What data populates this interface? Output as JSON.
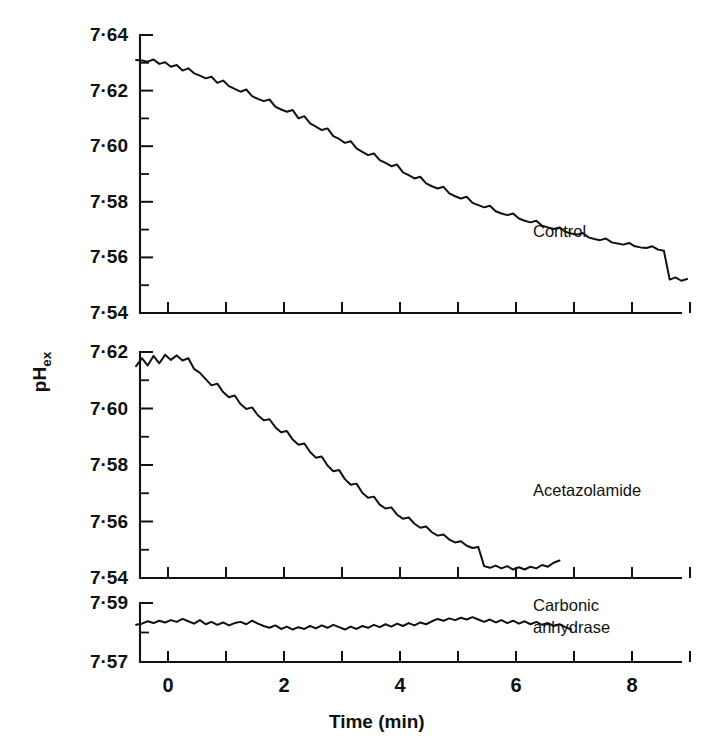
{
  "figure": {
    "axis_title_x": "Time (min)",
    "axis_title_y": "pH",
    "axis_title_y_sub": "ex",
    "panels": [
      {
        "name": "control",
        "label": "Control",
        "ylim": [
          7.54,
          7.64
        ],
        "yticks": [
          "7·64",
          "7·62",
          "7·60",
          "7·58",
          "7·56",
          "7·54"
        ],
        "ytick_values": [
          7.64,
          7.62,
          7.6,
          7.58,
          7.56,
          7.54
        ],
        "yminor_values": [
          7.63,
          7.61,
          7.59,
          7.57,
          7.55
        ]
      },
      {
        "name": "acetazolamide",
        "label": "Acetazolamide",
        "ylim": [
          7.54,
          7.62
        ],
        "yticks": [
          "7·62",
          "7·60",
          "7·58",
          "7·56",
          "7·54"
        ],
        "ytick_values": [
          7.62,
          7.6,
          7.58,
          7.56,
          7.54
        ],
        "yminor_values": [
          7.61,
          7.59,
          7.57,
          7.55
        ]
      },
      {
        "name": "carbonic-anhydrase",
        "label_line1": "Carbonic",
        "label_line2": "anhydrase",
        "label": "Carbonic anhydrase",
        "ylim": [
          7.57,
          7.59
        ],
        "yticks": [
          "7·59",
          "7·57"
        ],
        "ytick_values": [
          7.59,
          7.57
        ],
        "yminor_values": [
          7.58
        ]
      }
    ],
    "xticks_labeled": [
      "0",
      "2",
      "4",
      "6",
      "8"
    ],
    "xtick_label_values": [
      0,
      2,
      4,
      6,
      8
    ],
    "xtick_values": [
      0,
      1,
      2,
      3,
      4,
      5,
      6,
      7,
      8,
      9
    ],
    "colors": {
      "ink": "#111111",
      "background": "#ffffff"
    }
  },
  "chart_data": {
    "type": "line",
    "title": "",
    "xlabel": "Time (min)",
    "ylabel": "pHex",
    "grid": false,
    "legend": "inline-panel-labels",
    "panels": [
      {
        "name": "Control",
        "ylabel": "pHex",
        "xlim": [
          -0.6,
          9.0
        ],
        "ylim": [
          7.54,
          7.64
        ],
        "yticks": [
          7.54,
          7.56,
          7.58,
          7.6,
          7.62,
          7.64
        ],
        "xticks": [
          0,
          1,
          2,
          3,
          4,
          5,
          6,
          7,
          8,
          9
        ],
        "series": [
          {
            "name": "Control",
            "x": [
              -0.55,
              -0.45,
              -0.35,
              -0.25,
              -0.15,
              -0.05,
              0.05,
              0.15,
              0.25,
              0.35,
              0.45,
              0.55,
              0.65,
              0.75,
              0.85,
              0.95,
              1.05,
              1.15,
              1.25,
              1.35,
              1.45,
              1.55,
              1.65,
              1.75,
              1.85,
              1.95,
              2.05,
              2.15,
              2.25,
              2.35,
              2.45,
              2.55,
              2.65,
              2.75,
              2.85,
              2.95,
              3.05,
              3.15,
              3.25,
              3.35,
              3.45,
              3.55,
              3.65,
              3.75,
              3.85,
              3.95,
              4.05,
              4.15,
              4.25,
              4.35,
              4.45,
              4.55,
              4.65,
              4.75,
              4.85,
              4.95,
              5.05,
              5.15,
              5.25,
              5.35,
              5.45,
              5.55,
              5.65,
              5.75,
              5.85,
              5.95,
              6.05,
              6.15,
              6.25,
              6.35,
              6.45,
              6.55,
              6.65,
              6.75,
              6.85,
              6.95,
              7.05,
              7.15,
              7.25,
              7.35,
              7.45,
              7.55,
              7.65,
              7.75,
              7.85,
              7.95,
              8.05,
              8.15,
              8.25,
              8.35,
              8.45,
              8.55,
              8.65,
              8.75,
              8.85,
              8.95
            ],
            "y": [
              7.631,
              7.6308,
              7.6304,
              7.6312,
              7.6296,
              7.6302,
              7.6286,
              7.6292,
              7.6272,
              7.628,
              7.6262,
              7.6254,
              7.6244,
              7.625,
              7.6228,
              7.6236,
              7.6216,
              7.6206,
              7.6196,
              7.6204,
              7.618,
              7.617,
              7.6162,
              7.6168,
              7.6142,
              7.6132,
              7.6124,
              7.613,
              7.61,
              7.6108,
              7.6082,
              7.607,
              7.6058,
              7.6064,
              7.6036,
              7.6026,
              7.6012,
              7.6018,
              7.5992,
              7.598,
              7.5968,
              7.5974,
              7.595,
              7.594,
              7.5928,
              7.5934,
              7.5906,
              7.5896,
              7.5884,
              7.589,
              7.5866,
              7.5856,
              7.5848,
              7.5854,
              7.583,
              7.582,
              7.5812,
              7.5818,
              7.5796,
              7.5788,
              7.578,
              7.5786,
              7.5766,
              7.5758,
              7.5752,
              7.5758,
              7.574,
              7.5732,
              7.5726,
              7.5732,
              7.5714,
              7.5708,
              7.5702,
              7.5708,
              7.5692,
              7.5686,
              7.5682,
              7.5688,
              7.5672,
              7.5666,
              7.5662,
              7.5668,
              7.5654,
              7.565,
              7.5646,
              7.5652,
              7.564,
              7.5636,
              7.5634,
              7.564,
              7.5628,
              7.5624,
              7.552,
              7.5528,
              7.5516,
              7.5522
            ]
          }
        ]
      },
      {
        "name": "Acetazolamide",
        "ylabel": "pHex",
        "xlim": [
          -0.6,
          9.0
        ],
        "ylim": [
          7.54,
          7.62
        ],
        "yticks": [
          7.54,
          7.56,
          7.58,
          7.6,
          7.62
        ],
        "xticks": [
          0,
          1,
          2,
          3,
          4,
          5,
          6,
          7,
          8,
          9
        ],
        "series": [
          {
            "name": "Acetazolamide",
            "x": [
              -0.55,
              -0.45,
              -0.35,
              -0.25,
              -0.15,
              -0.05,
              0.05,
              0.15,
              0.25,
              0.35,
              0.45,
              0.55,
              0.65,
              0.75,
              0.85,
              0.95,
              1.05,
              1.15,
              1.25,
              1.35,
              1.45,
              1.55,
              1.65,
              1.75,
              1.85,
              1.95,
              2.05,
              2.15,
              2.25,
              2.35,
              2.45,
              2.55,
              2.65,
              2.75,
              2.85,
              2.95,
              3.05,
              3.15,
              3.25,
              3.35,
              3.45,
              3.55,
              3.65,
              3.75,
              3.85,
              3.95,
              4.05,
              4.15,
              4.25,
              4.35,
              4.45,
              4.55,
              4.65,
              4.75,
              4.85,
              4.95,
              5.05,
              5.15,
              5.25,
              5.35,
              5.45,
              5.55,
              5.65,
              5.75,
              5.85,
              5.95,
              6.05,
              6.15,
              6.25,
              6.35,
              6.45,
              6.55,
              6.65,
              6.75
            ],
            "y": [
              7.615,
              7.6178,
              7.6152,
              7.6186,
              7.616,
              7.619,
              7.6172,
              7.6188,
              7.617,
              7.6178,
              7.614,
              7.6126,
              7.6104,
              7.6082,
              7.6088,
              7.6058,
              7.604,
              7.6046,
              7.6016,
              7.5998,
              7.6004,
              7.5976,
              7.5958,
              7.5962,
              7.5934,
              7.5916,
              7.592,
              7.589,
              7.5872,
              7.5876,
              7.5846,
              7.5826,
              7.583,
              7.5798,
              7.5778,
              7.5782,
              7.575,
              7.573,
              7.5734,
              7.5702,
              7.5684,
              7.5688,
              7.566,
              7.5646,
              7.565,
              7.5624,
              7.561,
              7.5614,
              7.5592,
              7.5578,
              7.5582,
              7.5562,
              7.555,
              7.5554,
              7.5536,
              7.5526,
              7.553,
              7.5514,
              7.5506,
              7.551,
              7.5442,
              7.5436,
              7.5444,
              7.5434,
              7.5442,
              7.543,
              7.5438,
              7.543,
              7.544,
              7.5434,
              7.5446,
              7.544,
              7.5454,
              7.5462
            ]
          }
        ]
      },
      {
        "name": "Carbonic anhydrase",
        "ylabel": "pHex",
        "xlim": [
          -0.6,
          9.0
        ],
        "ylim": [
          7.57,
          7.59
        ],
        "yticks": [
          7.57,
          7.58,
          7.59
        ],
        "xticks": [
          0,
          1,
          2,
          3,
          4,
          5,
          6,
          7,
          8,
          9
        ],
        "series": [
          {
            "name": "Carbonic anhydrase",
            "x": [
              -0.55,
              -0.45,
              -0.35,
              -0.25,
              -0.15,
              -0.05,
              0.05,
              0.15,
              0.25,
              0.35,
              0.45,
              0.55,
              0.65,
              0.75,
              0.85,
              0.95,
              1.05,
              1.15,
              1.25,
              1.35,
              1.45,
              1.55,
              1.65,
              1.75,
              1.85,
              1.95,
              2.05,
              2.15,
              2.25,
              2.35,
              2.45,
              2.55,
              2.65,
              2.75,
              2.85,
              2.95,
              3.05,
              3.15,
              3.25,
              3.35,
              3.45,
              3.55,
              3.65,
              3.75,
              3.85,
              3.95,
              4.05,
              4.15,
              4.25,
              4.35,
              4.45,
              4.55,
              4.65,
              4.75,
              4.85,
              4.95,
              5.05,
              5.15,
              5.25,
              5.35,
              5.45,
              5.55,
              5.65,
              5.75,
              5.85,
              5.95,
              6.05,
              6.15,
              6.25,
              6.35,
              6.45,
              6.55,
              6.65,
              6.75,
              6.85,
              6.95
            ],
            "y": [
              7.5826,
              7.583,
              7.5838,
              7.5832,
              7.584,
              7.5834,
              7.5842,
              7.5836,
              7.5846,
              7.5838,
              7.583,
              7.5842,
              7.5828,
              7.5836,
              7.5826,
              7.5834,
              7.5824,
              7.5832,
              7.5836,
              7.5828,
              7.584,
              7.583,
              7.5822,
              7.5816,
              7.5824,
              7.5812,
              7.582,
              7.581,
              7.5818,
              7.5812,
              7.5822,
              7.5814,
              7.5824,
              7.5816,
              7.5826,
              7.5818,
              7.581,
              7.582,
              7.5812,
              7.5822,
              7.5816,
              7.5826,
              7.5818,
              7.5828,
              7.582,
              7.583,
              7.5822,
              7.5832,
              7.5824,
              7.5834,
              7.5828,
              7.5838,
              7.5846,
              7.584,
              7.5848,
              7.5842,
              7.585,
              7.5844,
              7.5852,
              7.5844,
              7.5836,
              7.5844,
              7.5834,
              7.5842,
              7.5832,
              7.584,
              7.583,
              7.5838,
              7.5828,
              7.5836,
              7.5826,
              7.5832,
              7.5822,
              7.5828,
              7.5818,
              7.581
            ]
          }
        ]
      }
    ]
  }
}
